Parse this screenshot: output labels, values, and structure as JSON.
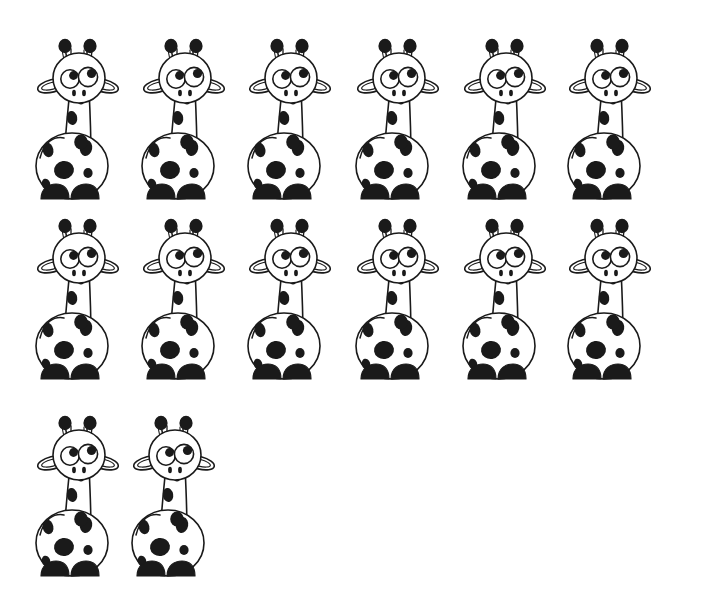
{
  "page": {
    "kind": "counting-worksheet-illustration",
    "background_color": "#ffffff",
    "ink_color": "#1a1a1a",
    "width": 704,
    "height": 615
  },
  "subject": {
    "name": "giraffe",
    "icon_name": "giraffe-icon",
    "total_count": 14,
    "style": "cartoon line drawing, black outline, black spots, white fill"
  },
  "chart_data": {
    "type": "pictogram",
    "title": "",
    "symbol": "giraffe",
    "total": 14,
    "rows": [
      {
        "index": 1,
        "count": 6,
        "top": 38
      },
      {
        "index": 2,
        "count": 6,
        "top": 218
      },
      {
        "index": 3,
        "count": 2,
        "top": 415
      }
    ],
    "columns_x": [
      28,
      134,
      240,
      348,
      455,
      560
    ],
    "row3_columns_x": [
      28,
      124
    ]
  },
  "parts": {
    "ossicone_left": "ossicone-left",
    "ossicone_right": "ossicone-right",
    "ear_left": "ear-left",
    "ear_right": "ear-right",
    "head": "head",
    "eye_left": "eye-left",
    "eye_right": "eye-right",
    "pupil_left": "pupil-left",
    "pupil_right": "pupil-right",
    "nostril_left": "nostril-left",
    "nostril_right": "nostril-right",
    "neck": "neck",
    "body": "body",
    "hoof_left": "hoof-left",
    "hoof_right": "hoof-right",
    "neck_spots": "neck-spots",
    "body_spots": "body-spots"
  },
  "colors": {
    "outline": "#1a1a1a",
    "fill": "#ffffff",
    "spot": "#1a1a1a",
    "hoof": "#1a1a1a"
  }
}
